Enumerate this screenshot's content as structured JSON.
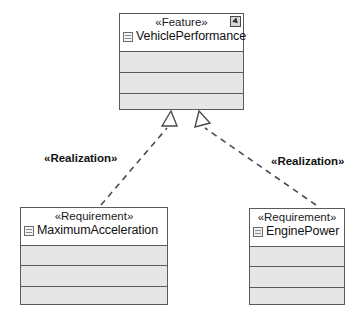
{
  "diagram": {
    "type": "uml-class-diagram",
    "background_color": "#ffffff",
    "line_color": "#5a5a5a",
    "compartment_fill": "#e6e6e6",
    "header_fill": "#ffffff"
  },
  "nodes": [
    {
      "id": "vehicle-performance",
      "stereotype": "«Feature»",
      "name": "VehiclePerformance",
      "icon": "block-icon",
      "corner_icon": "pin-icon",
      "empty_compartments": 3
    },
    {
      "id": "maximum-acceleration",
      "stereotype": "«Requirement»",
      "name": "MaximumAcceleration",
      "icon": "block-icon",
      "empty_compartments": 3
    },
    {
      "id": "engine-power",
      "stereotype": "«Requirement»",
      "name": "EnginePower",
      "icon": "block-icon",
      "empty_compartments": 3
    }
  ],
  "edges": [
    {
      "id": "realization-left",
      "label": "«Realization»",
      "from": "maximum-acceleration",
      "to": "vehicle-performance",
      "style": "dashed",
      "arrowhead": "hollow-triangle"
    },
    {
      "id": "realization-right",
      "label": "«Realization»",
      "from": "engine-power",
      "to": "vehicle-performance",
      "style": "dashed",
      "arrowhead": "hollow-triangle"
    }
  ]
}
